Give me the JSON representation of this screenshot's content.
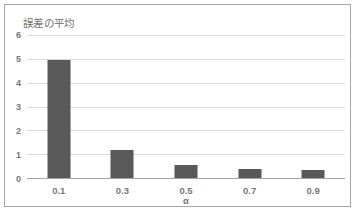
{
  "chart_data": {
    "type": "bar",
    "title": "誤差の平均",
    "xlabel": "α",
    "ylabel": "",
    "categories": [
      "0.1",
      "0.3",
      "0.5",
      "0.7",
      "0.9"
    ],
    "values": [
      4.95,
      1.17,
      0.55,
      0.38,
      0.35
    ],
    "series": [
      {
        "name": "誤差の平均",
        "values": [
          4.95,
          1.17,
          0.55,
          0.38,
          0.35
        ]
      }
    ],
    "ylim": [
      0,
      6
    ],
    "ytick_labels": [
      "6",
      "5",
      "4",
      "3",
      "2",
      "1",
      "0"
    ],
    "ytick_values": [
      6,
      5,
      4,
      3,
      2,
      1,
      0
    ],
    "ytick_step": 1,
    "grid": "horizontal",
    "legend": "none",
    "bar_color": "#595959",
    "gridline_color": "#d9d9d9",
    "axis_color": "#a6a6a6",
    "text_color": "#777777",
    "border_color": "#a6a6a6",
    "background": "#ffffff"
  }
}
